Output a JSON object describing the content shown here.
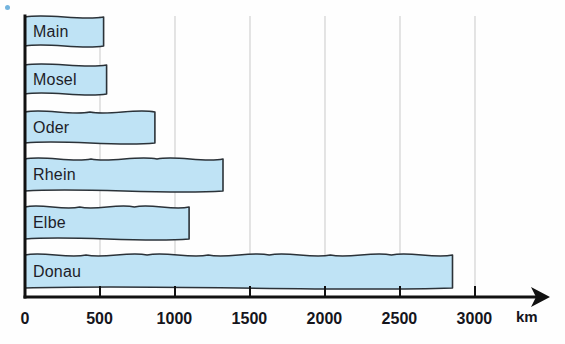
{
  "chart_data": {
    "type": "bar",
    "orientation": "horizontal",
    "title": "",
    "xlabel": "km",
    "ylabel": "",
    "categories": [
      "Main",
      "Mosel",
      "Oder",
      "Rhein",
      "Elbe",
      "Donau"
    ],
    "values": [
      524,
      544,
      866,
      1320,
      1094,
      2850
    ],
    "xlim": [
      0,
      3100
    ],
    "xticks": [
      0,
      500,
      1000,
      1500,
      2000,
      2500,
      3000
    ],
    "xtick_labels": [
      "0",
      "500",
      "1000",
      "1500",
      "2000",
      "2500",
      "3000"
    ],
    "grid": "vertical",
    "legend": "none",
    "bar_style": "wavy-river-ribbon",
    "colors": {
      "bar_fill": "#bfe3f5",
      "bar_stroke": "#2b3238",
      "axis": "#111111",
      "gridline": "#c9c9c9",
      "label_text": "#1d1d28"
    }
  },
  "axis": {
    "unit": "km",
    "ticks": [
      {
        "label": "0",
        "value": 0
      },
      {
        "label": "500",
        "value": 500
      },
      {
        "label": "1000",
        "value": 1000
      },
      {
        "label": "1500",
        "value": 1500
      },
      {
        "label": "2000",
        "value": 2000
      },
      {
        "label": "2500",
        "value": 2500
      },
      {
        "label": "3000",
        "value": 3000
      }
    ]
  },
  "bars": [
    {
      "label": "Main",
      "value": 524
    },
    {
      "label": "Mosel",
      "value": 544
    },
    {
      "label": "Oder",
      "value": 866
    },
    {
      "label": "Rhein",
      "value": 1320
    },
    {
      "label": "Elbe",
      "value": 1094
    },
    {
      "label": "Donau",
      "value": 2850
    }
  ]
}
